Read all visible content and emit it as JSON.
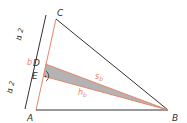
{
  "diagram": {
    "type": "geometry-triangle",
    "points": {
      "A": {
        "label": "A",
        "x": 36,
        "y": 110
      },
      "B": {
        "label": "B",
        "x": 168,
        "y": 110
      },
      "C": {
        "label": "C",
        "x": 56,
        "y": 19
      },
      "D": {
        "label": "D",
        "x": 45.5,
        "y": 64
      },
      "E": {
        "label": "E",
        "x": 43,
        "y": 76
      }
    },
    "segments": [
      {
        "name": "AC",
        "color": "#e8866a"
      },
      {
        "name": "CB",
        "color": "#333333"
      },
      {
        "name": "AB",
        "color": "#333333"
      },
      {
        "name": "DB",
        "color": "#e8866a",
        "label": "s_b"
      },
      {
        "name": "EB",
        "color": "#e8866a",
        "label": "h_b"
      }
    ],
    "labels": {
      "A": "A",
      "B": "B",
      "C": "C",
      "D": "D",
      "E": "E",
      "b": "b",
      "half_top_num": "b",
      "half_top_den": "2",
      "half_bottom_num": "b",
      "half_bottom_den": "2",
      "s_main": "s",
      "s_sub": "b",
      "h_main": "h",
      "h_sub": "b"
    },
    "colors": {
      "accent": "#e8866a",
      "line": "#333333",
      "shade": "#b3b3b3"
    }
  }
}
